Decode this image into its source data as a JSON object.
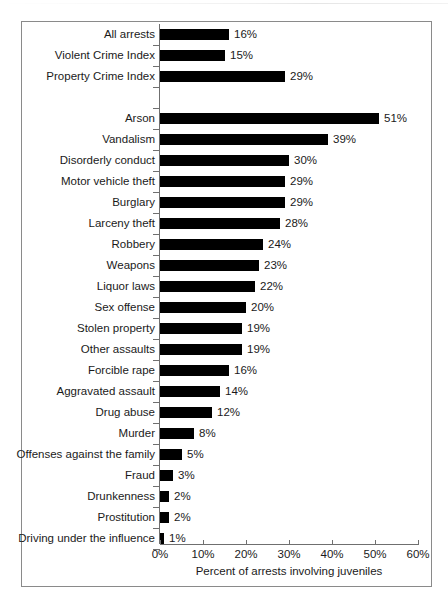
{
  "chart_data": {
    "type": "bar",
    "orientation": "horizontal",
    "title": "",
    "xlabel": "Percent of arrests involving juveniles",
    "ylabel": "",
    "xlim": [
      0,
      60
    ],
    "xticks": [
      "0%",
      "10%",
      "20%",
      "30%",
      "40%",
      "50%",
      "60%"
    ],
    "xtick_values": [
      0,
      10,
      20,
      30,
      40,
      50,
      60
    ],
    "grid": false,
    "legend": null,
    "bar_color": "#000000",
    "axis_color": "#6f6f6f",
    "border_color": "#8a8a8a",
    "value_suffix": "%",
    "categories": [
      "All arrests",
      "Violent Crime Index",
      "Property Crime Index",
      "",
      "Arson",
      "Vandalism",
      "Disorderly conduct",
      "Motor vehicle theft",
      "Burglary",
      "Larceny theft",
      "Robbery",
      "Weapons",
      "Liquor laws",
      "Sex offense",
      "Stolen property",
      "Other assaults",
      "Forcible rape",
      "Aggravated assault",
      "Drug abuse",
      "Murder",
      "Offenses against the family",
      "Fraud",
      "Drunkenness",
      "Prostitution",
      "Driving under the influence"
    ],
    "values": [
      16,
      15,
      29,
      null,
      51,
      39,
      30,
      29,
      29,
      28,
      24,
      23,
      22,
      20,
      19,
      19,
      16,
      14,
      12,
      8,
      5,
      3,
      2,
      2,
      1
    ],
    "value_labels": [
      "16%",
      "15%",
      "29%",
      "",
      "51%",
      "39%",
      "30%",
      "29%",
      "29%",
      "28%",
      "24%",
      "23%",
      "22%",
      "20%",
      "19%",
      "19%",
      "16%",
      "14%",
      "12%",
      "8%",
      "5%",
      "3%",
      "2%",
      "2%",
      "1%"
    ]
  }
}
